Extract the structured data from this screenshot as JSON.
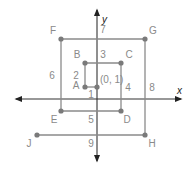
{
  "diagram": {
    "axes": {
      "x_label": "x",
      "y_label": "y"
    },
    "colors": {
      "axis": "#333333",
      "segment": "#8a8a8a",
      "point": "#7a7a7a",
      "label": "#8a8a8a"
    },
    "start_point": {
      "label": "(0, 1)",
      "x": 0,
      "y": 1
    },
    "points": [
      {
        "id": "A",
        "label": "A",
        "x": -1,
        "y": 1
      },
      {
        "id": "B",
        "label": "B",
        "x": -1,
        "y": 3
      },
      {
        "id": "C",
        "label": "C",
        "x": 2,
        "y": 3
      },
      {
        "id": "D",
        "label": "D",
        "x": 2,
        "y": -1
      },
      {
        "id": "E",
        "label": "E",
        "x": -3,
        "y": -1
      },
      {
        "id": "F",
        "label": "F",
        "x": -3,
        "y": 5
      },
      {
        "id": "G",
        "label": "G",
        "x": 4,
        "y": 5
      },
      {
        "id": "H",
        "label": "H",
        "x": 4,
        "y": -3
      },
      {
        "id": "J",
        "label": "J",
        "x": -5,
        "y": -3
      }
    ],
    "segments": [
      {
        "from": "start",
        "to": "A",
        "length_label": "1"
      },
      {
        "from": "A",
        "to": "B",
        "length_label": "2"
      },
      {
        "from": "B",
        "to": "C",
        "length_label": "3"
      },
      {
        "from": "C",
        "to": "D",
        "length_label": "4"
      },
      {
        "from": "D",
        "to": "E",
        "length_label": "5"
      },
      {
        "from": "E",
        "to": "F",
        "length_label": "6"
      },
      {
        "from": "F",
        "to": "G",
        "length_label": "7"
      },
      {
        "from": "G",
        "to": "H",
        "length_label": "8"
      },
      {
        "from": "H",
        "to": "J",
        "length_label": "9"
      }
    ]
  }
}
